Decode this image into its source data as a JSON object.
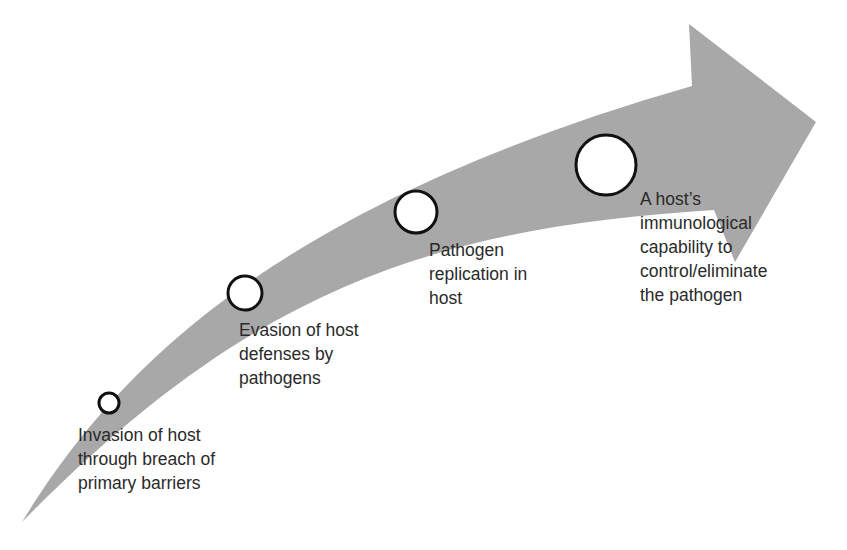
{
  "diagram": {
    "type": "curved-progression-arrow",
    "colors": {
      "arrow_fill": "#a8a8a8",
      "circle_fill": "#ffffff",
      "circle_stroke": "#111111",
      "text": "#2a2a2a",
      "background": "#ffffff"
    },
    "stages": [
      {
        "order": 1,
        "label": "Invasion of host\nthrough breach of\nprimary barriers",
        "marker_size": "small"
      },
      {
        "order": 2,
        "label": "Evasion of host\ndefenses by\npathogens",
        "marker_size": "medium"
      },
      {
        "order": 3,
        "label": "Pathogen\nreplication in\nhost",
        "marker_size": "medium-large"
      },
      {
        "order": 4,
        "label": "A host’s\nimmunological\ncapability to\ncontrol/eliminate\nthe pathogen",
        "marker_size": "large"
      }
    ]
  }
}
